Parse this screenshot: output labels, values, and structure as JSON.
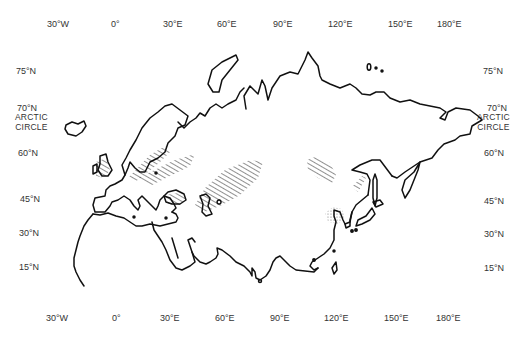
{
  "map": {
    "region": "Eurasia",
    "projection": "equirectangular-like outline map",
    "longitude_labels_top": [
      "30°W",
      "0°",
      "30°E",
      "60°E",
      "90°E",
      "120°E",
      "150°E",
      "180°E"
    ],
    "longitude_labels_bottom": [
      "30°W",
      "0°",
      "30°E",
      "60°E",
      "90°E",
      "120°E",
      "150°E",
      "180°E"
    ],
    "latitude_labels_left": [
      "75°N",
      "70°N",
      "60°N",
      "45°N",
      "30°N",
      "15°N"
    ],
    "latitude_labels_right": [
      "75°N",
      "70°N",
      "60°N",
      "45°N",
      "30°N",
      "15°N"
    ],
    "arctic_circle_label": [
      "ARCTIC",
      "CIRCLE"
    ],
    "colors": {
      "coastline": "#111111",
      "hatch": "#333333",
      "stipple": "#777777",
      "background": "#ffffff"
    },
    "marked_areas": [
      {
        "type": "hatched",
        "location": "Baltic / Northern Europe"
      },
      {
        "type": "hatched",
        "location": "Black Sea north coast"
      },
      {
        "type": "hatched",
        "location": "Caspian / Kazakh steppe"
      },
      {
        "type": "hatched",
        "location": "Central Siberia / Mongolia"
      },
      {
        "type": "hatched",
        "location": "Manchuria"
      },
      {
        "type": "stippled",
        "location": "North China Plain / Bohai"
      }
    ]
  }
}
